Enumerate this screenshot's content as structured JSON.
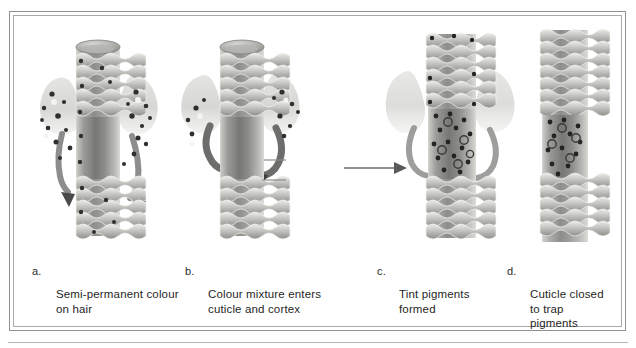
{
  "figure": {
    "title_alt": "Semi-permanent hair colour process diagram",
    "frame_color": "#8f9196",
    "background_color": "#ffffff"
  },
  "panels": [
    {
      "letter": "a.",
      "caption": "Semi-permanent colour\non hair",
      "illustration": "hair-shaft-open-cuticle-with-colour-molecules"
    },
    {
      "letter": "b.",
      "caption": "Colour mixture enters\ncuticle and cortex",
      "illustration": "hair-shaft-colour-entering-cortex-arrows"
    },
    {
      "letter": "c.",
      "caption": "Tint pigments\nformed",
      "illustration": "hair-shaft-tint-pigments-formed-in-cortex"
    },
    {
      "letter": "d.",
      "caption": "Cuticle closed\nto trap\npigments",
      "illustration": "hair-shaft-closed-cuticle-trapped-pigments"
    }
  ],
  "arrows": [
    {
      "name": "flow-arrow-b-to-c",
      "direction": "right"
    }
  ],
  "colors": {
    "ink": "#1f1f1f",
    "frame": "#8f9196",
    "rule": "#b4b6ba",
    "shaft_mid": "#9a9a98",
    "shaft_dark": "#6f6f6d",
    "shaft_light": "#cfcfcd",
    "molecule": "#3a3a38"
  }
}
